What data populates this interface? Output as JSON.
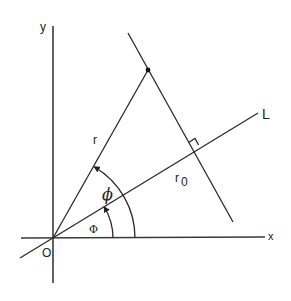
{
  "diagram": {
    "type": "geometry",
    "labels": {
      "y_axis": "y",
      "x_axis": "x",
      "origin": "O",
      "line": "L",
      "radius": "r",
      "perp_distance_main": "r",
      "perp_distance_sub": "0",
      "angle_phi": "ϕ",
      "angle_Phi": "Φ"
    },
    "colors": {
      "stroke": "#2a2a2a",
      "background": "#ffffff"
    },
    "geometry": {
      "origin": [
        53,
        238
      ],
      "x_axis": {
        "from": [
          21,
          238
        ],
        "to": [
          265,
          237
        ]
      },
      "y_axis": {
        "from": [
          53,
          26
        ],
        "to": [
          53,
          283
        ]
      },
      "line_L": {
        "from": [
          20,
          258
        ],
        "to": [
          258,
          113
        ]
      },
      "radius_r": {
        "from": [
          53,
          238
        ],
        "to": [
          148,
          70
        ]
      },
      "perpendicular_line": {
        "from": [
          128,
          33
        ],
        "to": [
          233,
          222
        ]
      },
      "point": [
        148,
        70
      ],
      "foot_of_perpendicular": [
        193,
        150
      ],
      "arc_phi_radius": 82,
      "arc_Phi_radius": 60
    }
  }
}
